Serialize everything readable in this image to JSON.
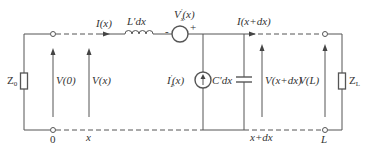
{
  "diagram": {
    "type": "transmission-line-equivalent-circuit",
    "labels": {
      "z0": "Z",
      "z0_sub": "0",
      "zl": "Z",
      "zl_sub": "L",
      "current_in": "I(x)",
      "inductor": "L′dx",
      "voltage_source": "V",
      "voltage_source_sub": "x",
      "voltage_source_sup": "′",
      "voltage_source_arg": "(x)",
      "minus": "-",
      "plus": "+",
      "current_out": "I(x+dx)",
      "current_source": "I",
      "current_source_sub": "z",
      "current_source_sup": "′",
      "current_source_arg": "(x)",
      "capacitor": "C′dx",
      "v0": "V(0)",
      "vx": "V(x)",
      "vxdx": "V(x+dx)",
      "vl": "V(L)",
      "pos_0": "0",
      "pos_x": "x",
      "pos_xdx": "x+dx",
      "pos_L": "L"
    },
    "colors": {
      "wire": "#555555",
      "text": "#333333"
    }
  }
}
